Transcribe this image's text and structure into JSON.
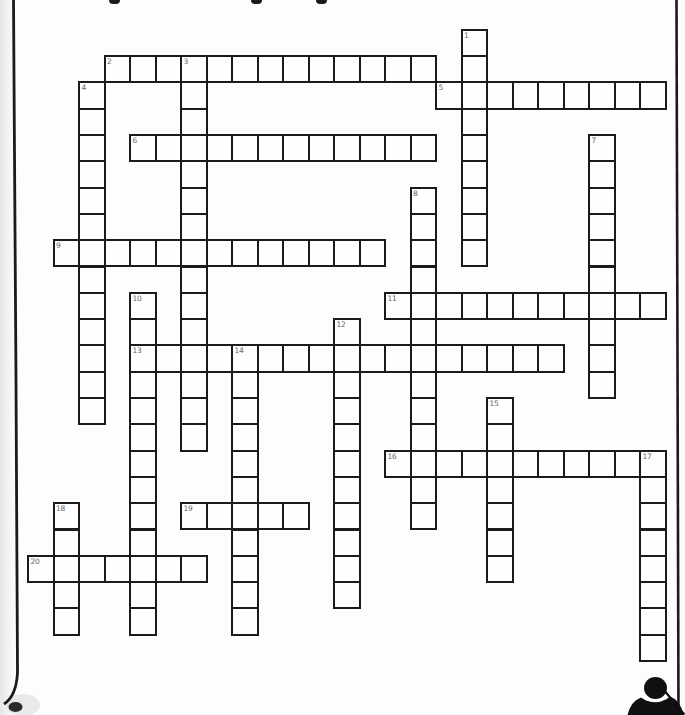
{
  "page": {
    "width": 685,
    "height": 715,
    "background": "#fdfdfd",
    "line_color": "#1b1b1b",
    "cell_fill": "#fefefe",
    "clue_number_color": "#666666"
  },
  "artifacts": {
    "left_page_edge": "curled scanned page edge line, bottom-left curl with shadow blob",
    "right_page_edge": "vertical page edge line",
    "top_text_fragments_x": [
      109,
      251,
      316
    ],
    "bottom_right_figure": "small black person silhouette clipart with diagonal pole"
  },
  "puzzle": {
    "type": "crossword",
    "grid": {
      "cell_w": 25.5,
      "cell_h": 26.3,
      "offset_x": 1.5,
      "offset_y": 2.5,
      "border_px": 2
    },
    "words": [
      {
        "number": 1,
        "dir": "down",
        "col": 18,
        "row": 1,
        "len": 9
      },
      {
        "number": 2,
        "dir": "across",
        "col": 4,
        "row": 2,
        "len": 13
      },
      {
        "number": 3,
        "dir": "down",
        "col": 7,
        "row": 2,
        "len": 15
      },
      {
        "number": 4,
        "dir": "down",
        "col": 3,
        "row": 3,
        "len": 13
      },
      {
        "number": 5,
        "dir": "across",
        "col": 17,
        "row": 3,
        "len": 9
      },
      {
        "number": 6,
        "dir": "across",
        "col": 5,
        "row": 5,
        "len": 12
      },
      {
        "number": 7,
        "dir": "down",
        "col": 23,
        "row": 5,
        "len": 10
      },
      {
        "number": 8,
        "dir": "down",
        "col": 16,
        "row": 7,
        "len": 13
      },
      {
        "number": 9,
        "dir": "across",
        "col": 2,
        "row": 9,
        "len": 13
      },
      {
        "number": 10,
        "dir": "down",
        "col": 5,
        "row": 11,
        "len": 13
      },
      {
        "number": 11,
        "dir": "across",
        "col": 15,
        "row": 11,
        "len": 11
      },
      {
        "number": 12,
        "dir": "down",
        "col": 13,
        "row": 12,
        "len": 11
      },
      {
        "number": 13,
        "dir": "across",
        "col": 5,
        "row": 13,
        "len": 17
      },
      {
        "number": 14,
        "dir": "down",
        "col": 9,
        "row": 13,
        "len": 11
      },
      {
        "number": 15,
        "dir": "down",
        "col": 19,
        "row": 15,
        "len": 7
      },
      {
        "number": 16,
        "dir": "across",
        "col": 15,
        "row": 17,
        "len": 11
      },
      {
        "number": 17,
        "dir": "down",
        "col": 25,
        "row": 17,
        "len": 8
      },
      {
        "number": 18,
        "dir": "down",
        "col": 2,
        "row": 19,
        "len": 5
      },
      {
        "number": 19,
        "dir": "across",
        "col": 7,
        "row": 19,
        "len": 5
      },
      {
        "number": 20,
        "dir": "across",
        "col": 1,
        "row": 21,
        "len": 7
      }
    ]
  }
}
